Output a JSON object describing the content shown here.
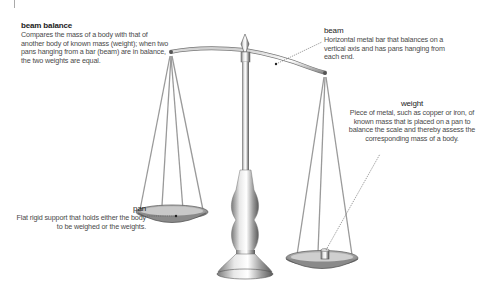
{
  "diagram": {
    "labels": {
      "beam_balance": {
        "title": "beam balance",
        "text": "Compares the mass of a body with that of another body of known mass (weight); when two pans hanging from a bar (beam) are in balance, the two weights are equal."
      },
      "beam": {
        "title": "beam",
        "text": "Horizontal metal bar that balances on a vertical axis and has pans hanging from each end."
      },
      "weight": {
        "title": "weight",
        "text": "Piece of metal, such as copper or iron, of known mass that is placed on a pan to balance the scale and thereby assess the corresponding mass of a body."
      },
      "pan": {
        "title": "pan",
        "text": "Flat rigid support that holds either the body to be weighed or the weights."
      }
    },
    "colors": {
      "metal_light": "#f2f2f2",
      "metal_mid": "#b8b8b8",
      "metal_dark": "#6e6e6e",
      "leader_line": "#555555"
    }
  }
}
